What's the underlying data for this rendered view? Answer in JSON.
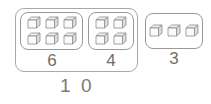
{
  "diagram": {
    "type": "part-whole-cube-groups",
    "outer_group": {
      "name": "ten-frame-group",
      "total_label": "1 0",
      "total_value": 10,
      "parts": [
        {
          "label": "6",
          "value": 6,
          "rows": 2,
          "cols": 3,
          "cube_icon": "cube-icon"
        },
        {
          "label": "4",
          "value": 4,
          "rows": 2,
          "cols": 2,
          "cube_icon": "cube-icon"
        }
      ]
    },
    "standalone_group": {
      "label": "3",
      "value": 3,
      "rows": 1,
      "cols": 3,
      "cube_icon": "cube-icon"
    },
    "colors": {
      "outline": "#a8a8a8",
      "group_outline": "#9a9a9a",
      "cube_line": "#8c8c8c",
      "cube_top": "#f2f2f2",
      "cube_front": "#fbfbfb",
      "cube_side": "#dcdcdc",
      "label_text": "#6e6e6e",
      "total_text": "#7a7a7a",
      "background": "#ffffff"
    }
  }
}
